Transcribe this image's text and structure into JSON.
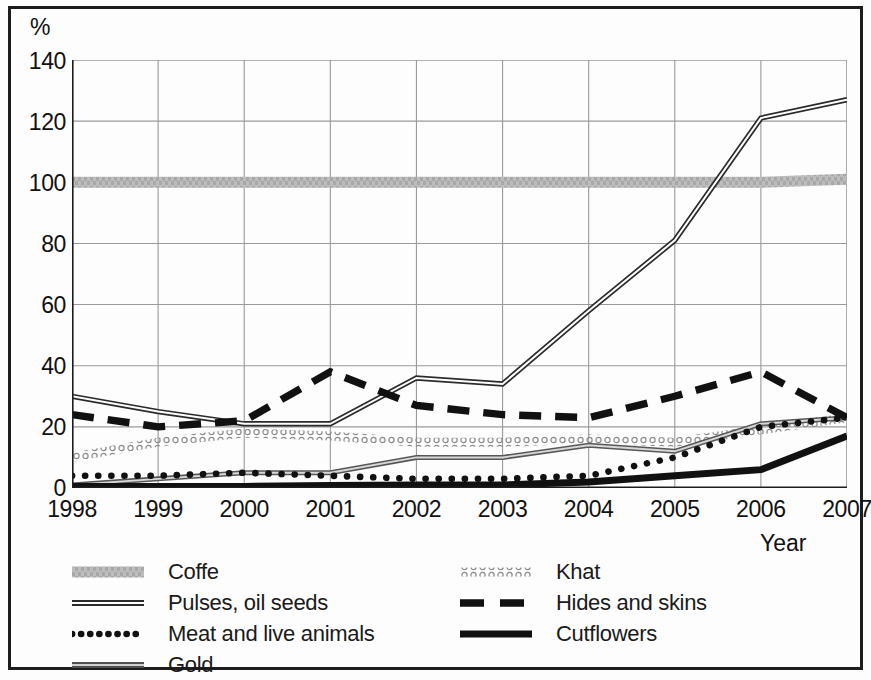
{
  "axes": {
    "y_unit_label": "%",
    "y_ticks": [
      "140",
      "120",
      "100",
      "80",
      "60",
      "40",
      "20",
      "0"
    ],
    "x_ticks": [
      "1998",
      "1999",
      "2000",
      "2001",
      "2002",
      "2003",
      "2004",
      "2005",
      "2006",
      "2007"
    ],
    "x_axis_title": "Year"
  },
  "legend": {
    "left": [
      {
        "label": "Coffe",
        "style": "thick-grey-band",
        "color": "#b3b3b3"
      },
      {
        "label": "Pulses, oil seeds",
        "style": "double-line",
        "color": "#2b2b2b"
      },
      {
        "label": "Meat and live animals",
        "style": "dotted",
        "color": "#111111"
      },
      {
        "label": "Gold",
        "style": "grey-double-line",
        "color": "#6f6f6f"
      }
    ],
    "right": [
      {
        "label": "Khat",
        "style": "chain-circles",
        "color": "#8a8a8a"
      },
      {
        "label": "Hides and skins",
        "style": "thick-dashed",
        "color": "#111111"
      },
      {
        "label": "Cutflowers",
        "style": "thick-solid",
        "color": "#111111"
      }
    ]
  },
  "chart_data": {
    "type": "line",
    "title": "",
    "xlabel": "Year",
    "ylabel": "%",
    "x": [
      1998,
      1999,
      2000,
      2001,
      2002,
      2003,
      2004,
      2005,
      2006,
      2007
    ],
    "xlim": [
      1998,
      2007
    ],
    "ylim": [
      0,
      140
    ],
    "y_ticks": [
      0,
      20,
      40,
      60,
      80,
      100,
      120,
      140
    ],
    "grid": true,
    "legend_position": "below",
    "series": [
      {
        "name": "Coffe",
        "style": "thick-grey-band",
        "color": "#b3b3b3",
        "values": [
          100,
          100,
          100,
          100,
          100,
          100,
          100,
          100,
          100,
          101
        ]
      },
      {
        "name": "Pulses, oil seeds",
        "style": "double-line",
        "color": "#2b2b2b",
        "values": [
          30,
          25,
          21,
          21,
          36,
          34,
          58,
          81,
          121,
          127
        ]
      },
      {
        "name": "Meat and live animals",
        "style": "dotted",
        "color": "#111111",
        "values": [
          4,
          4,
          5,
          4,
          3,
          3,
          4,
          10,
          20,
          23
        ]
      },
      {
        "name": "Gold",
        "style": "grey-double-line",
        "color": "#6f6f6f",
        "values": [
          1,
          3,
          5,
          5,
          10,
          10,
          14,
          12,
          21,
          23
        ]
      },
      {
        "name": "Khat",
        "style": "chain-circles",
        "color": "#8a8a8a",
        "values": [
          10,
          15,
          18,
          17,
          15,
          15,
          16,
          15,
          19,
          23
        ]
      },
      {
        "name": "Hides and skins",
        "style": "thick-dashed",
        "color": "#111111",
        "values": [
          24,
          20,
          22,
          38,
          27,
          24,
          23,
          30,
          38,
          23
        ]
      },
      {
        "name": "Cutflowers",
        "style": "thick-solid",
        "color": "#111111",
        "values": [
          0.5,
          0.5,
          0.5,
          0.8,
          1,
          1,
          2,
          4,
          6,
          17
        ]
      }
    ]
  }
}
